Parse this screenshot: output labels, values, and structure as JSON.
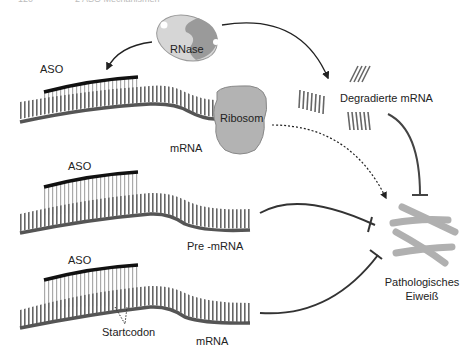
{
  "header": {
    "page_number": "120",
    "chapter": "2 ASO Mechanismen"
  },
  "labels": {
    "rnase": "RNase",
    "ribosom": "Ribosom",
    "degraded": "Degradierte mRNA",
    "aso1": "ASO",
    "mrna1": "mRNA",
    "aso2": "ASO",
    "pre_mrna": "Pre -mRNA",
    "aso3": "ASO",
    "startcodon": "Startcodon",
    "mrna3": "mRNA",
    "protein_line1": "Pathologisches",
    "protein_line2": "Eiweiß"
  },
  "colors": {
    "strand": "#555555",
    "aso": "#111111",
    "rungs_aso": "#aaaaaa",
    "ribosome": "#b3b3b3",
    "rnase_light": "#d6d6d6",
    "rnase_dark": "#9a9a9a",
    "protein": "#b0b0b0",
    "arrow": "#333333"
  }
}
